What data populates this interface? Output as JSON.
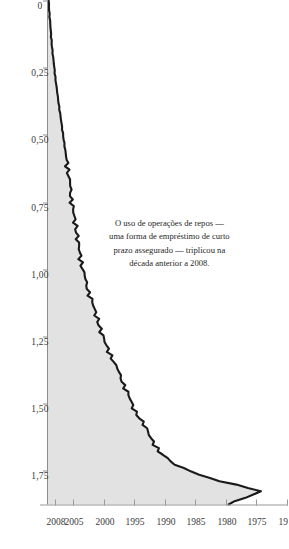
{
  "chart_data": {
    "type": "area",
    "title": "",
    "subtitle": "",
    "xlabel": "",
    "ylabel": "",
    "orientation": "rotated-90-clockwise",
    "xlim": [
      1970,
      2008
    ],
    "ylim": [
      0,
      1.875
    ],
    "grid": false,
    "legend": null,
    "x_tick_labels": [
      "1970",
      "1975",
      "1980",
      "1985",
      "1990",
      "1995",
      "2000",
      "2005",
      "2008"
    ],
    "x_tick_values": [
      1970,
      1975,
      1980,
      1985,
      1990,
      1995,
      2000,
      2005,
      2008
    ],
    "y_tick_labels": [
      "0",
      "0,25",
      "0,50",
      "0,75",
      "1,00",
      "1,25",
      "1,50",
      "1,75"
    ],
    "y_tick_values": [
      0,
      0.25,
      0.5,
      0.75,
      1.0,
      1.25,
      1.5,
      1.75
    ],
    "decimal_separator": ",",
    "series": [
      {
        "name": "Uso de operações de repos",
        "fill_color": "#e2e2e2",
        "line_color": "#1a1a1a",
        "x": [
          1970,
          1971,
          1972,
          1973,
          1974,
          1975,
          1976,
          1977,
          1978,
          1979,
          1980,
          1981,
          1982,
          1983,
          1984,
          1985,
          1986,
          1987,
          1988,
          1989,
          1990,
          1991,
          1992,
          1993,
          1994,
          1995,
          1996,
          1997,
          1998,
          1999,
          2000,
          2001,
          2002,
          2003,
          2004,
          2005,
          2006,
          2007,
          2008
        ],
        "values": [
          0.005,
          0.012,
          0.02,
          0.028,
          0.038,
          0.05,
          0.062,
          0.075,
          0.09,
          0.105,
          0.12,
          0.135,
          0.15,
          0.165,
          0.178,
          0.19,
          0.205,
          0.225,
          0.24,
          0.255,
          0.275,
          0.3,
          0.33,
          0.365,
          0.4,
          0.43,
          0.47,
          0.52,
          0.57,
          0.615,
          0.66,
          0.705,
          0.78,
          0.83,
          0.9,
          1.02,
          1.3,
          1.72,
          1.46
        ],
        "quarterly": true
      }
    ]
  },
  "annotation": {
    "lines": [
      "O uso de operações de repos —",
      "uma forma de empréstimo de curto",
      "prazo assegurado — triplicou na",
      "década anterior a 2008."
    ],
    "full_text": "O uso de operações de repos — uma forma de empréstimo de curto prazo assegurado — triplicou na década anterior a 2008."
  },
  "colors": {
    "background": "#ffffff",
    "area_fill": "#e2e2e2",
    "line": "#1a1a1a",
    "axis": "#8d8d8d",
    "text": "#2b2b2b"
  }
}
